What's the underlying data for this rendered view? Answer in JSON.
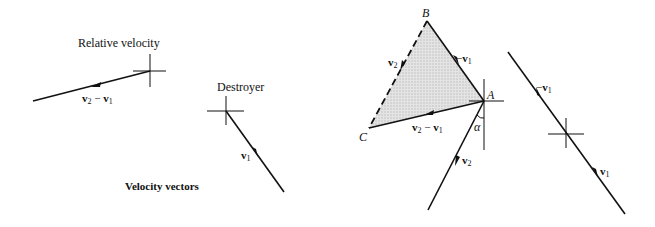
{
  "figure": {
    "left_panel": {
      "relative_velocity": {
        "title": "Relative velocity",
        "vector_label": {
          "main": "v",
          "sub1": "2",
          "op": " − ",
          "main2": "v",
          "sub2": "1"
        }
      },
      "destroyer": {
        "title": "Destroyer",
        "vector_label": {
          "main": "v",
          "sub": "1"
        }
      },
      "caption": "Velocity vectors"
    },
    "right_panel": {
      "points": {
        "A": "A",
        "B": "B",
        "C": "C"
      },
      "angle_label": "α",
      "edge_BA": {
        "prefix": "−",
        "main": "v",
        "sub": "1"
      },
      "edge_BC": {
        "main": "v",
        "sub": "2"
      },
      "edge_AC": {
        "main": "v",
        "sub1": "2",
        "op": " − ",
        "main2": "v",
        "sub2": "1"
      },
      "line_A_v2": {
        "main": "v",
        "sub": "2"
      },
      "right_line_upper": {
        "prefix": "−",
        "main": "v",
        "sub": "1"
      },
      "right_line_lower": {
        "main": "v",
        "sub": "1"
      }
    },
    "colors": {
      "ink": "#111111",
      "shade": "#d9d9d9",
      "background": "#ffffff"
    }
  }
}
